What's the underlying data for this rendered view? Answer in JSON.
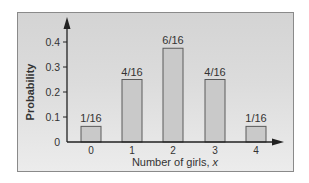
{
  "chart_data": {
    "type": "bar",
    "title": "",
    "xlabel": "Number of girls, x",
    "xlabel_main": "Number of girls, ",
    "xlabel_var": "x",
    "ylabel": "Probability",
    "categories": [
      "0",
      "1",
      "2",
      "3",
      "4"
    ],
    "values": [
      0.0625,
      0.25,
      0.375,
      0.25,
      0.0625
    ],
    "bar_labels": [
      "1/16",
      "4/16",
      "6/16",
      "4/16",
      "1/16"
    ],
    "yticks": [
      "0",
      "0.1",
      "0.2",
      "0.3",
      "0.4"
    ],
    "ylim": [
      0,
      0.45
    ],
    "grid": false,
    "legend": null,
    "colors": {
      "bar_fill": "#c9c9c9",
      "bar_stroke": "#5a5a5a",
      "axis": "#222222"
    }
  }
}
